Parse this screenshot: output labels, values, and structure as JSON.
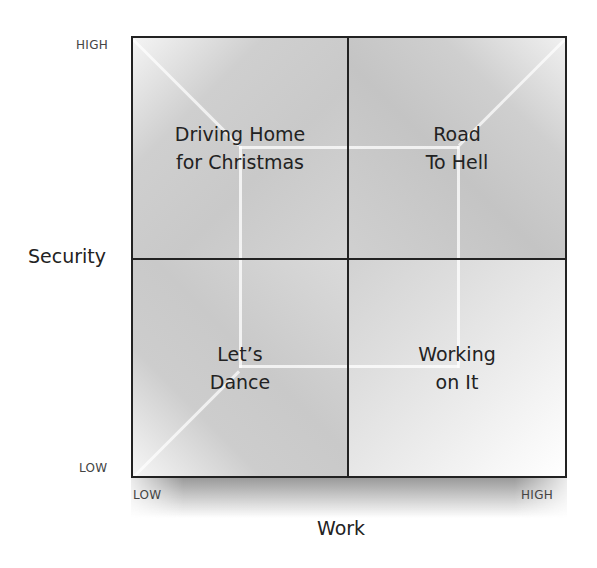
{
  "diagram": {
    "type": "2x2 matrix",
    "y_axis": {
      "title": "Security",
      "high_label": "HIGH",
      "low_label": "LOW"
    },
    "x_axis": {
      "title": "Work",
      "low_label": "LOW",
      "high_label": "HIGH"
    },
    "quadrants": {
      "top_left": {
        "line1": "Driving Home",
        "line2": "for Christmas"
      },
      "top_right": {
        "line1": "Road",
        "line2": "To Hell"
      },
      "bottom_left": {
        "line1": "Let’s",
        "line2": "Dance"
      },
      "bottom_right": {
        "line1": "Working",
        "line2": "on It"
      }
    },
    "colors": {
      "border": "#222222",
      "text": "#222222",
      "tick_text": "#444444",
      "background": "#ffffff"
    }
  }
}
